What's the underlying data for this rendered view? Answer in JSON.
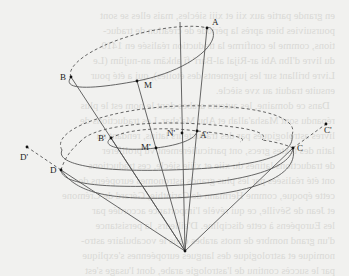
{
  "diagram": {
    "title": "",
    "background_text_bleed": true,
    "colors": {
      "background": "#f1f1ef",
      "line": "#555555",
      "dashed": "#666666",
      "point": "#111111",
      "label": "#222222"
    },
    "vertex": {
      "x": 185,
      "y": 251
    },
    "points": [
      {
        "id": "A",
        "label": "A",
        "x": 207,
        "y": 28,
        "lx": 212,
        "ly": 25
      },
      {
        "id": "B",
        "label": "B",
        "x": 71,
        "y": 77,
        "lx": 60,
        "ly": 80
      },
      {
        "id": "M",
        "label": "M",
        "x": 137,
        "y": 81,
        "lx": 144,
        "ly": 88
      },
      {
        "id": "B'",
        "label": "B'",
        "x": 111,
        "y": 138,
        "lx": 98,
        "ly": 141
      },
      {
        "id": "M'",
        "label": "M'",
        "x": 156,
        "y": 148,
        "lx": 141,
        "ly": 150
      },
      {
        "id": "N'",
        "label": "N'",
        "x": 182,
        "y": 133,
        "lx": 167,
        "ly": 136
      },
      {
        "id": "A'",
        "label": "A'",
        "x": 197,
        "y": 131,
        "lx": 200,
        "ly": 138
      },
      {
        "id": "C",
        "label": "C",
        "x": 293,
        "y": 148,
        "lx": 297,
        "ly": 151
      },
      {
        "id": "C'",
        "label": "C'",
        "x": 326,
        "y": 124,
        "lx": 325,
        "ly": 123
      },
      {
        "id": "D",
        "label": "D",
        "x": 61,
        "y": 170,
        "lx": 50,
        "ly": 168
      },
      {
        "id": "D'",
        "label": "D'",
        "x": 27,
        "y": 147,
        "lx": 21,
        "ly": 159
      }
    ],
    "labels": {
      "A": "A",
      "B": "B",
      "M": "M",
      "B_prime": "B'",
      "M_prime": "M'",
      "N_prime": "N'",
      "A_prime": "A'",
      "C": "C",
      "C_prime": "C'",
      "D": "D",
      "D_prime": "D'"
    }
  }
}
